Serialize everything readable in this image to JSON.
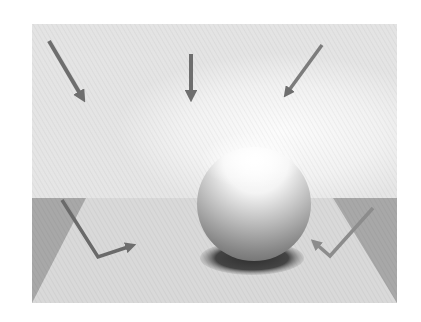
{
  "figure": {
    "type": "lighting-diagram",
    "frame": {
      "x": 32,
      "y": 24,
      "width": 365,
      "height": 279
    },
    "horizon_y": 198,
    "colors": {
      "wall": "#e6e6e6",
      "wall_highlight": "#ffffff",
      "floor": "#d8d8d8",
      "floor_side_panels": "#a9a9a9",
      "arrow": "#6e6e6e",
      "arrow_reflected": "#8a8a8a",
      "sphere_light": "#ffffff",
      "sphere_dark": "#6a6a6a",
      "shadow": "#3c3c3c"
    },
    "incident_arrows": [
      {
        "name": "left-diagonal",
        "from": [
          49,
          41
        ],
        "to": [
          84,
          101
        ]
      },
      {
        "name": "center-vertical",
        "from": [
          191,
          54
        ],
        "to": [
          191,
          100
        ]
      },
      {
        "name": "right-diagonal",
        "from": [
          322,
          45
        ],
        "to": [
          284,
          97
        ]
      }
    ],
    "reflected_arrows": [
      {
        "name": "left-bounce",
        "points": [
          [
            62,
            200
          ],
          [
            98,
            257
          ],
          [
            136,
            245
          ]
        ]
      },
      {
        "name": "right-bounce",
        "points": [
          [
            373,
            208
          ],
          [
            330,
            256
          ],
          [
            312,
            240
          ]
        ]
      }
    ],
    "sphere": {
      "cx": 254,
      "cy": 204,
      "r": 57
    },
    "shadow": {
      "cx": 252,
      "cy": 258,
      "rx": 52,
      "ry": 17
    }
  }
}
